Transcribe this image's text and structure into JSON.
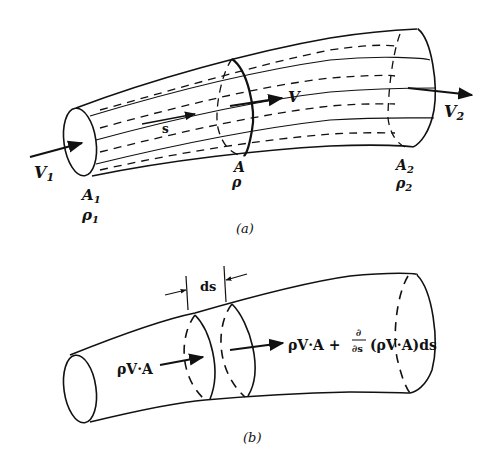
{
  "figure_a": {
    "caption": "(a)",
    "labels": {
      "inlet_velocity": "V",
      "inlet_velocity_sub": "1",
      "inlet_area": "A",
      "inlet_area_sub": "1",
      "inlet_density": "ρ",
      "inlet_density_sub": "1",
      "streamline_coord": "s",
      "mid_velocity": "V",
      "mid_area": "A",
      "mid_density": "ρ",
      "outlet_velocity": "V",
      "outlet_velocity_sub": "2",
      "outlet_area": "A",
      "outlet_area_sub": "2",
      "outlet_density": "ρ",
      "outlet_density_sub": "2"
    }
  },
  "figure_b": {
    "caption": "(b)",
    "labels": {
      "element_length": "ds",
      "inflow": "ρV·A",
      "outflow_base": "ρV·A +",
      "partial_num": "∂",
      "partial_den": "∂s",
      "outflow_tail": "(ρV·A)ds"
    }
  },
  "colors": {
    "ink": "#111111",
    "background": "#ffffff"
  }
}
